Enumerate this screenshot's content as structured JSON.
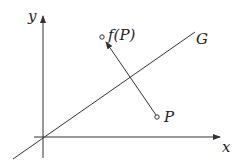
{
  "diagram": {
    "axes": {
      "x_label": "x",
      "y_label": "y"
    },
    "line": {
      "label": "G"
    },
    "points": [
      {
        "id": "P",
        "label": "P"
      },
      {
        "id": "fP",
        "label": "f(P)"
      }
    ],
    "colors": {
      "stroke": "#333333",
      "text": "#222222",
      "background": "#ffffff"
    }
  }
}
